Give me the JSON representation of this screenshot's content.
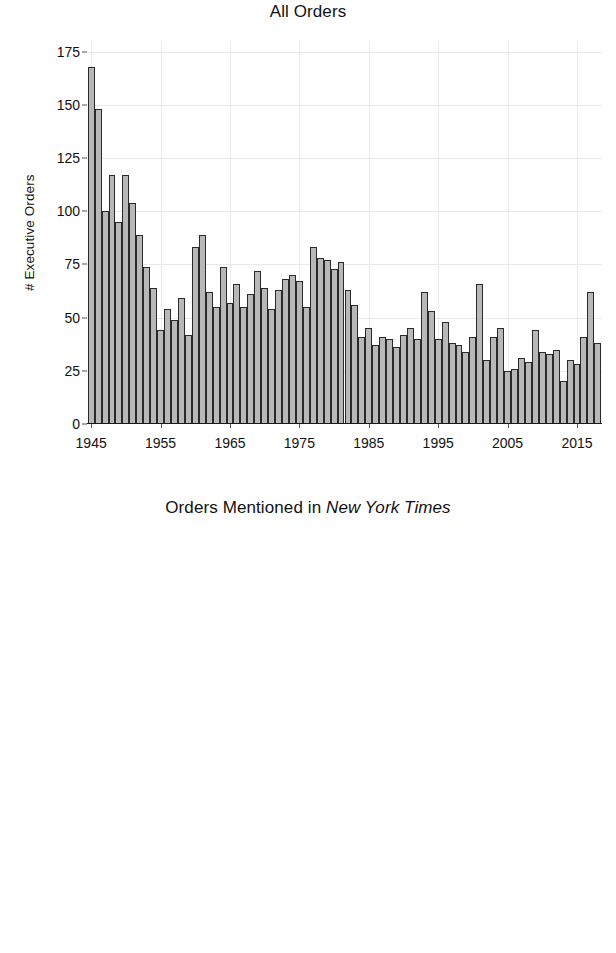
{
  "figure": {
    "width": 616,
    "height": 953,
    "background": "#ffffff",
    "bar_fill": "#b8b8b8",
    "bar_edge": "#2a2a2a",
    "grid_color": "#e9e9e9"
  },
  "panels": [
    {
      "id": "top",
      "title_plain": "All Orders",
      "title_italic": "",
      "ylabel": "# Executive Orders"
    },
    {
      "id": "bottom",
      "title_plain": "Orders Mentioned in ",
      "title_italic": "New York Times",
      "ylabel": "# Executive Orders"
    }
  ],
  "axes": {
    "yticks": [
      0,
      25,
      50,
      75,
      100,
      125,
      150,
      175
    ],
    "ytick_labels": [
      "0",
      "25",
      "50",
      "75",
      "100",
      "125",
      "150",
      "175"
    ],
    "ylim": [
      0,
      180
    ],
    "xticks": [
      1945,
      1955,
      1965,
      1975,
      1985,
      1995,
      2005,
      2015
    ],
    "xtick_labels": [
      "1945",
      "1955",
      "1965",
      "1975",
      "1985",
      "1995",
      "2005",
      "2015"
    ],
    "xlim": [
      1944.4,
      2018.6
    ]
  },
  "chart_data": [
    {
      "type": "bar",
      "title": "All Orders",
      "xlabel": "",
      "ylabel": "# Executive Orders",
      "ylim": [
        0,
        180
      ],
      "grid": true,
      "legend": "none",
      "categories": [
        1945,
        1946,
        1947,
        1948,
        1949,
        1950,
        1951,
        1952,
        1953,
        1954,
        1955,
        1956,
        1957,
        1958,
        1959,
        1960,
        1961,
        1962,
        1963,
        1964,
        1965,
        1966,
        1967,
        1968,
        1969,
        1970,
        1971,
        1972,
        1973,
        1974,
        1975,
        1976,
        1977,
        1978,
        1979,
        1980,
        1981,
        1982,
        1983,
        1984,
        1985,
        1986,
        1987,
        1988,
        1989,
        1990,
        1991,
        1992,
        1993,
        1994,
        1995,
        1996,
        1997,
        1998,
        1999,
        2000,
        2001,
        2002,
        2003,
        2004,
        2005,
        2006,
        2007,
        2008,
        2009,
        2010,
        2011,
        2012,
        2013,
        2014,
        2015,
        2016,
        2017,
        2018
      ],
      "values": [
        168,
        148,
        100,
        117,
        95,
        117,
        104,
        89,
        74,
        64,
        44,
        54,
        49,
        59,
        42,
        83,
        89,
        62,
        55,
        74,
        57,
        66,
        55,
        61,
        72,
        64,
        54,
        63,
        68,
        70,
        67,
        55,
        83,
        78,
        77,
        73,
        76,
        63,
        56,
        41,
        45,
        37,
        41,
        40,
        36,
        42,
        45,
        40,
        62,
        53,
        40,
        48,
        38,
        37,
        34,
        41,
        66,
        30,
        41,
        45,
        25,
        26,
        31,
        29,
        44,
        34,
        33,
        35,
        20,
        30,
        28,
        41,
        62,
        38
      ],
      "yticks": [
        0,
        25,
        50,
        75,
        100,
        125,
        150,
        175
      ],
      "xticks": [
        1945,
        1955,
        1965,
        1975,
        1985,
        1995,
        2005,
        2015
      ]
    },
    {
      "type": "bar",
      "title": "Orders Mentioned in New York Times",
      "xlabel": "",
      "ylabel": "# Executive Orders",
      "ylim": [
        0,
        180
      ],
      "grid": true,
      "legend": "none",
      "categories": [
        1945,
        1946,
        1947,
        1948,
        1949,
        1950,
        1951,
        1952,
        1953,
        1954,
        1955,
        1956,
        1957,
        1958,
        1959,
        1960,
        1961,
        1962,
        1963,
        1964,
        1965,
        1966,
        1967,
        1968,
        1969,
        1970,
        1971,
        1972,
        1973,
        1974,
        1975,
        1976,
        1977,
        1978,
        1979,
        1980,
        1981,
        1982,
        1983,
        1984,
        1985,
        1986,
        1987,
        1988,
        1989,
        1990,
        1991,
        1992,
        1993,
        1994,
        1995,
        1996,
        1997,
        1998,
        1999,
        2000,
        2001,
        2002,
        2003,
        2004,
        2005,
        2006,
        2007,
        2008,
        2009,
        2010,
        2011,
        2012,
        2013,
        2014,
        2015,
        2016,
        2017,
        2018
      ],
      "values": [
        45,
        49,
        30,
        27,
        16,
        29,
        29,
        24,
        30,
        15,
        22,
        11,
        17,
        7,
        16,
        14,
        31,
        42,
        28,
        15,
        12,
        20,
        13,
        17,
        17,
        16,
        21,
        19,
        19,
        17,
        12,
        12,
        9,
        13,
        14,
        15,
        28,
        14,
        5,
        6,
        12,
        11,
        8,
        8,
        7,
        11,
        7,
        7,
        16,
        8,
        11,
        7,
        6,
        11,
        10,
        7,
        21,
        9,
        7,
        12,
        3,
        10,
        7,
        13,
        6,
        10,
        7,
        7,
        16,
        12,
        4,
        34,
        15,
        0
      ],
      "yticks": [
        0,
        25,
        50,
        75,
        100,
        125,
        150,
        175
      ],
      "xticks": [
        1945,
        1955,
        1965,
        1975,
        1985,
        1995,
        2005,
        2015
      ]
    }
  ]
}
